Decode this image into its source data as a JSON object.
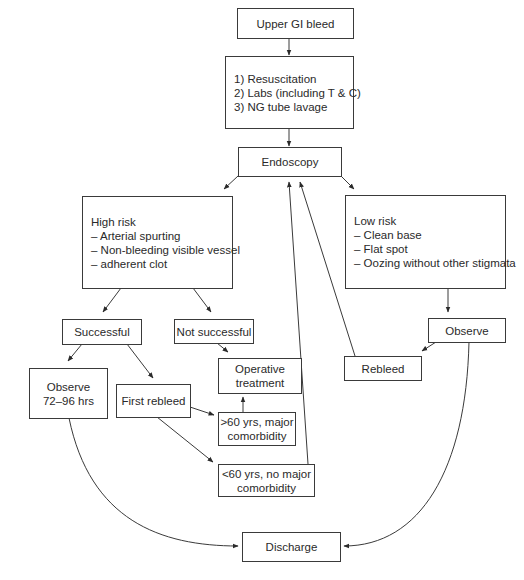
{
  "diagram": {
    "type": "flowchart",
    "nodes": {
      "upper_gi_bleed": {
        "lines": [
          "Upper GI bleed"
        ]
      },
      "initial_management": {
        "lines": [
          "1) Resuscitation",
          "2) Labs (including T & C)",
          "3) NG tube lavage"
        ]
      },
      "endoscopy": {
        "lines": [
          "Endoscopy"
        ]
      },
      "high_risk": {
        "lines": [
          "High risk",
          "– Arterial spurting",
          "– Non-bleeding visible vessel",
          "– adherent clot"
        ]
      },
      "low_risk": {
        "lines": [
          "Low risk",
          "– Clean base",
          "– Flat spot",
          "– Oozing without other stigmata"
        ]
      },
      "successful": {
        "lines": [
          "Successful"
        ]
      },
      "not_successful": {
        "lines": [
          "Not successful"
        ]
      },
      "observe_72_96": {
        "lines": [
          "Observe",
          "72–96 hrs"
        ]
      },
      "first_rebleed": {
        "lines": [
          "First rebleed"
        ]
      },
      "operative_treatment": {
        "lines": [
          "Operative",
          "treatment"
        ]
      },
      "over_60": {
        "lines": [
          ">60 yrs, major",
          "comorbidity"
        ]
      },
      "under_60": {
        "lines": [
          "<60 yrs, no major",
          "comorbidity"
        ]
      },
      "observe_low": {
        "lines": [
          "Observe"
        ]
      },
      "rebleed": {
        "lines": [
          "Rebleed"
        ]
      },
      "discharge": {
        "lines": [
          "Discharge"
        ]
      }
    },
    "edges": [
      [
        "upper_gi_bleed",
        "initial_management"
      ],
      [
        "initial_management",
        "endoscopy"
      ],
      [
        "endoscopy",
        "high_risk"
      ],
      [
        "endoscopy",
        "low_risk"
      ],
      [
        "high_risk",
        "successful"
      ],
      [
        "high_risk",
        "not_successful"
      ],
      [
        "successful",
        "observe_72_96"
      ],
      [
        "successful",
        "first_rebleed"
      ],
      [
        "not_successful",
        "operative_treatment"
      ],
      [
        "first_rebleed",
        "over_60"
      ],
      [
        "first_rebleed",
        "under_60"
      ],
      [
        "over_60",
        "operative_treatment"
      ],
      [
        "under_60",
        "endoscopy"
      ],
      [
        "low_risk",
        "observe_low"
      ],
      [
        "observe_low",
        "rebleed"
      ],
      [
        "rebleed",
        "endoscopy"
      ],
      [
        "observe_72_96",
        "discharge"
      ],
      [
        "observe_low",
        "discharge"
      ]
    ]
  }
}
